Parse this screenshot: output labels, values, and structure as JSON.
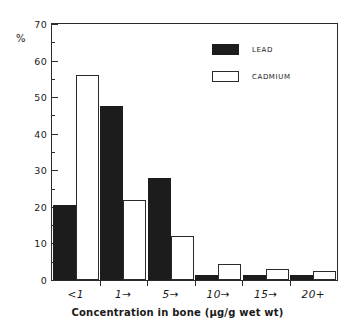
{
  "chart_data": {
    "type": "bar",
    "title": "",
    "xlabel": "Concentration in bone (µg/g wet wt)",
    "ylabel": "%",
    "categories": [
      "<1",
      "1→",
      "5→",
      "10→",
      "15→",
      "20+"
    ],
    "series": [
      {
        "name": "LEAD",
        "color": "#1c1c1c",
        "values": [
          20.5,
          47.5,
          28,
          1.5,
          1.5,
          1.5
        ]
      },
      {
        "name": "CADMIUM",
        "color": "#ffffff",
        "values": [
          56,
          22,
          12,
          4.5,
          3,
          2.5
        ]
      }
    ],
    "ylim": [
      0,
      70
    ],
    "ytick_labels": [
      "0",
      "10",
      "20",
      "30",
      "40",
      "50",
      "60",
      "70"
    ],
    "ytick_values": [
      0,
      10,
      20,
      30,
      40,
      50,
      60,
      70
    ],
    "yminor_step": 5,
    "grid": false,
    "legend_position": "top-right"
  },
  "legend": {
    "items": [
      {
        "label": "LEAD",
        "swatch": "filled-black"
      },
      {
        "label": "CADMIUM",
        "swatch": "open-white"
      }
    ]
  },
  "axes": {
    "y_unit_label": "%",
    "x_axis_title": "Concentration in bone (µg/g wet wt)"
  }
}
